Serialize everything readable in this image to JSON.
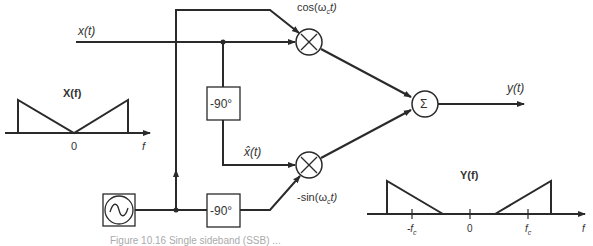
{
  "diagram": {
    "signals": {
      "input": "x(t)",
      "hilbert": "x̂(t)",
      "output": "y(t)",
      "cos_carrier": "cos(ω",
      "cos_sub": "c",
      "cos_tail": "t)",
      "sin_carrier": "-sin(ω",
      "sin_sub": "c",
      "sin_tail": "t)"
    },
    "blocks": {
      "phase_shift_top": "-90°",
      "phase_shift_bottom": "-90°",
      "summer": "Σ",
      "multiplier": "×",
      "oscillator": "~"
    },
    "spectrum_input": {
      "title": "X(f)",
      "zero": "0",
      "axis": "f"
    },
    "spectrum_output": {
      "title": "Y(f)",
      "neg_fc": "-f",
      "neg_fc_sub": "c",
      "zero": "0",
      "pos_fc": "f",
      "pos_fc_sub": "c",
      "axis": "f"
    },
    "caption": "Figure 10.16  Single sideband (SSB) ..."
  },
  "colors": {
    "line": "#2a2a2a",
    "text": "#333333"
  }
}
